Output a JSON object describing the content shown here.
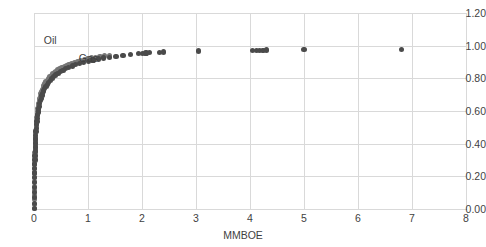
{
  "chart_data": {
    "type": "scatter",
    "title": "",
    "subtitle": "",
    "xlabel": "MMBOE",
    "ylabel": "",
    "xlim": [
      0,
      8
    ],
    "ylim": [
      0.0,
      1.2
    ],
    "grid": true,
    "legend_position": "inline-annotation",
    "x_ticks": [
      "0",
      "1",
      "2",
      "3",
      "4",
      "5",
      "6",
      "7",
      "8"
    ],
    "x_tick_values": [
      0,
      1,
      2,
      3,
      4,
      5,
      6,
      7,
      8
    ],
    "y_ticks": [
      "0.00",
      "0.20",
      "0.40",
      "0.60",
      "0.80",
      "1.00",
      "1.20"
    ],
    "y_tick_values": [
      0.0,
      0.2,
      0.4,
      0.6,
      0.8,
      1.0,
      1.2
    ],
    "annotations": [
      {
        "text": "Oil",
        "x": 0.18,
        "y": 1.03
      },
      {
        "text": "Gas",
        "x": 0.83,
        "y": 0.92
      }
    ],
    "series": [
      {
        "name": "Oil",
        "color": "#767676",
        "points": [
          [
            0.005,
            0.005
          ],
          [
            0.006,
            0.03
          ],
          [
            0.007,
            0.058
          ],
          [
            0.008,
            0.085
          ],
          [
            0.009,
            0.112
          ],
          [
            0.01,
            0.14
          ],
          [
            0.011,
            0.167
          ],
          [
            0.012,
            0.193
          ],
          [
            0.013,
            0.22
          ],
          [
            0.014,
            0.246
          ],
          [
            0.015,
            0.272
          ],
          [
            0.017,
            0.298
          ],
          [
            0.018,
            0.322
          ],
          [
            0.02,
            0.347
          ],
          [
            0.022,
            0.371
          ],
          [
            0.024,
            0.394
          ],
          [
            0.026,
            0.417
          ],
          [
            0.029,
            0.44
          ],
          [
            0.032,
            0.462
          ],
          [
            0.035,
            0.483
          ],
          [
            0.039,
            0.504
          ],
          [
            0.043,
            0.524
          ],
          [
            0.047,
            0.543
          ],
          [
            0.052,
            0.562
          ],
          [
            0.058,
            0.58
          ],
          [
            0.064,
            0.598
          ],
          [
            0.071,
            0.615
          ],
          [
            0.078,
            0.631
          ],
          [
            0.086,
            0.647
          ],
          [
            0.095,
            0.662
          ],
          [
            0.105,
            0.677
          ],
          [
            0.116,
            0.691
          ],
          [
            0.128,
            0.705
          ],
          [
            0.141,
            0.718
          ],
          [
            0.155,
            0.731
          ],
          [
            0.17,
            0.743
          ],
          [
            0.187,
            0.755
          ],
          [
            0.205,
            0.766
          ],
          [
            0.224,
            0.777
          ],
          [
            0.245,
            0.788
          ],
          [
            0.268,
            0.798
          ],
          [
            0.292,
            0.808
          ],
          [
            0.318,
            0.817
          ],
          [
            0.346,
            0.826
          ],
          [
            0.376,
            0.835
          ],
          [
            0.408,
            0.843
          ],
          [
            0.442,
            0.851
          ],
          [
            0.478,
            0.858
          ],
          [
            0.517,
            0.866
          ],
          [
            0.558,
            0.873
          ],
          [
            0.602,
            0.879
          ],
          [
            0.649,
            0.886
          ],
          [
            0.699,
            0.892
          ],
          [
            0.752,
            0.898
          ],
          [
            0.808,
            0.903
          ],
          [
            0.868,
            0.909
          ],
          [
            0.931,
            0.914
          ],
          [
            0.998,
            0.919
          ],
          [
            1.069,
            0.924
          ],
          [
            1.144,
            0.928
          ],
          [
            1.223,
            0.933
          ],
          [
            1.307,
            0.937
          ],
          [
            1.395,
            0.941
          ]
        ]
      },
      {
        "name": "Gas",
        "color": "#4a4a4a",
        "points": [
          [
            0.004,
            0.004
          ],
          [
            0.005,
            0.035
          ],
          [
            0.006,
            0.068
          ],
          [
            0.007,
            0.1
          ],
          [
            0.008,
            0.131
          ],
          [
            0.009,
            0.161
          ],
          [
            0.01,
            0.191
          ],
          [
            0.012,
            0.22
          ],
          [
            0.013,
            0.248
          ],
          [
            0.015,
            0.276
          ],
          [
            0.017,
            0.303
          ],
          [
            0.019,
            0.329
          ],
          [
            0.021,
            0.355
          ],
          [
            0.024,
            0.38
          ],
          [
            0.027,
            0.404
          ],
          [
            0.03,
            0.428
          ],
          [
            0.034,
            0.451
          ],
          [
            0.038,
            0.473
          ],
          [
            0.043,
            0.495
          ],
          [
            0.048,
            0.516
          ],
          [
            0.054,
            0.536
          ],
          [
            0.061,
            0.556
          ],
          [
            0.068,
            0.575
          ],
          [
            0.076,
            0.594
          ],
          [
            0.085,
            0.612
          ],
          [
            0.095,
            0.629
          ],
          [
            0.106,
            0.646
          ],
          [
            0.118,
            0.662
          ],
          [
            0.132,
            0.678
          ],
          [
            0.147,
            0.693
          ],
          [
            0.163,
            0.708
          ],
          [
            0.181,
            0.722
          ],
          [
            0.201,
            0.736
          ],
          [
            0.223,
            0.749
          ],
          [
            0.247,
            0.762
          ],
          [
            0.273,
            0.774
          ],
          [
            0.302,
            0.786
          ],
          [
            0.333,
            0.798
          ],
          [
            0.367,
            0.809
          ],
          [
            0.404,
            0.82
          ],
          [
            0.445,
            0.83
          ],
          [
            0.489,
            0.84
          ],
          [
            0.537,
            0.849
          ],
          [
            0.589,
            0.858
          ],
          [
            0.645,
            0.867
          ],
          [
            0.706,
            0.875
          ],
          [
            0.772,
            0.883
          ],
          [
            0.843,
            0.891
          ],
          [
            0.92,
            0.898
          ],
          [
            1.003,
            0.905
          ],
          [
            1.092,
            0.912
          ],
          [
            1.188,
            0.918
          ],
          [
            1.291,
            0.924
          ],
          [
            1.401,
            0.93
          ],
          [
            1.52,
            0.935
          ],
          [
            1.647,
            0.941
          ],
          [
            1.783,
            0.946
          ],
          [
            1.928,
            0.95
          ],
          [
            2.01,
            0.953
          ],
          [
            2.075,
            0.955
          ],
          [
            2.14,
            0.957
          ],
          [
            2.33,
            0.96
          ],
          [
            2.4,
            0.961
          ],
          [
            3.05,
            0.967
          ],
          [
            4.05,
            0.97
          ],
          [
            4.12,
            0.971
          ],
          [
            4.18,
            0.972
          ],
          [
            4.24,
            0.972
          ],
          [
            4.31,
            0.973
          ],
          [
            5.0,
            0.975
          ],
          [
            6.8,
            0.978
          ]
        ]
      }
    ]
  }
}
